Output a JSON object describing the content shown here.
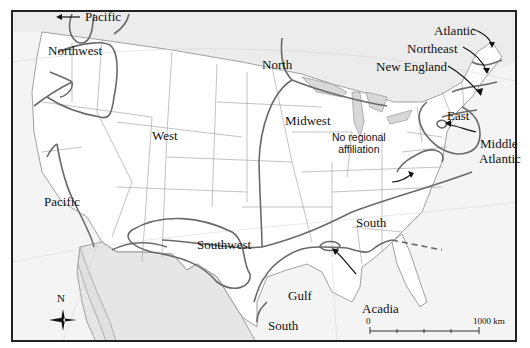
{
  "map": {
    "title": "Regional dialect affiliation map of the United States",
    "colors": {
      "land_us": "#ffffff",
      "land_foreign": "#e8e8e8",
      "water": "#f4f4f4",
      "state_borders": "#8a8a8a",
      "region_lines": "#6a6a6a",
      "frame": "#222222",
      "text": "#111111"
    },
    "region_labels": [
      {
        "id": "pacific-north",
        "text": "Pacific"
      },
      {
        "id": "northwest",
        "text": "Northwest"
      },
      {
        "id": "north",
        "text": "North"
      },
      {
        "id": "west",
        "text": "West"
      },
      {
        "id": "midwest",
        "text": "Midwest"
      },
      {
        "id": "atlantic",
        "text": "Atlantic"
      },
      {
        "id": "northeast",
        "text": "Northeast"
      },
      {
        "id": "new-england",
        "text": "New England"
      },
      {
        "id": "east",
        "text": "East"
      },
      {
        "id": "middle-atlantic-1",
        "text": "Middle"
      },
      {
        "id": "middle-atlantic-2",
        "text": "Atlantic"
      },
      {
        "id": "pacific-south",
        "text": "Pacific"
      },
      {
        "id": "southwest",
        "text": "Southwest"
      },
      {
        "id": "south",
        "text": "South"
      },
      {
        "id": "gulf",
        "text": "Gulf"
      },
      {
        "id": "acadia",
        "text": "Acadia"
      },
      {
        "id": "south-texas",
        "text": "South"
      }
    ],
    "annotation": {
      "line1": "No regional",
      "line2": "affiliation"
    },
    "compass": {
      "label": "N"
    },
    "scale_bar": {
      "start": "0",
      "end": "1000 km"
    }
  }
}
